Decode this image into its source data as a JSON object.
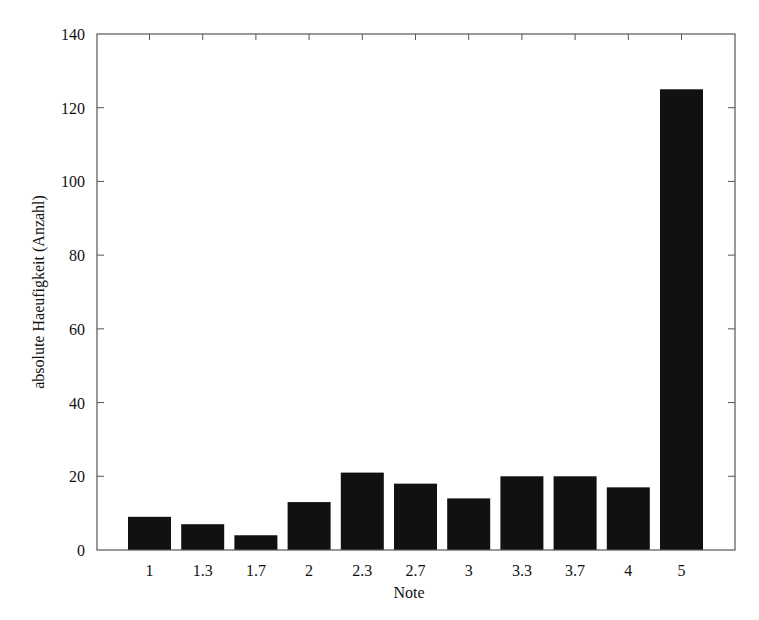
{
  "chart_data": {
    "type": "bar",
    "title": "",
    "xlabel": "Note",
    "ylabel": "absolute Haeufigkeit (Anzahl)",
    "categories": [
      "1",
      "1.3",
      "1.7",
      "2",
      "2.3",
      "2.7",
      "3",
      "3.3",
      "3.7",
      "4",
      "5"
    ],
    "values": [
      9,
      7,
      4,
      13,
      21,
      18,
      14,
      20,
      20,
      17,
      125
    ],
    "ylim": [
      0,
      140
    ],
    "yticks": [
      0,
      20,
      40,
      60,
      80,
      100,
      120,
      140
    ],
    "grid": false,
    "legend": null,
    "bar_color": "#111111"
  },
  "layout": {
    "plot": {
      "left": 97,
      "top": 34,
      "right": 735,
      "bottom": 550
    },
    "first_bar_center": 149.5,
    "bar_spacing": 53.2,
    "bar_width": 43
  }
}
